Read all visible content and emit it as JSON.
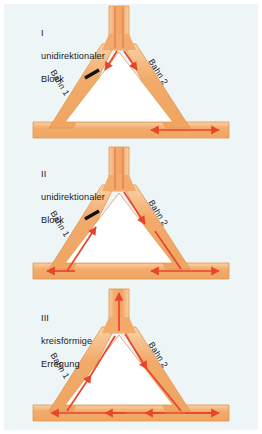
{
  "figure": {
    "background_color": "#eef5f6",
    "conduction_path_fill": "#f5b97a",
    "conduction_path_edge": "#e59a57",
    "conduction_path_highlight": "#fbd9b0",
    "arrow_color": "#e8452c",
    "block_mark_color": "#111111",
    "text_color": "#1b1b1b"
  },
  "panels": [
    {
      "roman": "I",
      "title_line_1": "unidirektionaler",
      "title_line_2": "Block",
      "branch_1_label": "Bahn 1",
      "branch_2_label": "Bahn 2",
      "has_block_mark": true,
      "stem_flow": "none",
      "left_branch_flow": "down-blocked",
      "right_branch_flow": "down",
      "bottom_bar_flow": "bidirectional-right-half"
    },
    {
      "roman": "II",
      "title_line_1": "unidirektionaler",
      "title_line_2": "Block",
      "branch_1_label": "Bahn 1",
      "branch_2_label": "Bahn 2",
      "has_block_mark": true,
      "stem_flow": "none",
      "left_branch_flow": "up",
      "right_branch_flow": "down",
      "bottom_bar_flow": "left-and-bidirectional-right"
    },
    {
      "roman": "III",
      "title_line_1": "kreisförmige",
      "title_line_2": "Erregung",
      "branch_1_label": "Bahn 1",
      "branch_2_label": "Bahn 2",
      "has_block_mark": false,
      "stem_flow": "up",
      "left_branch_flow": "up",
      "right_branch_flow": "down",
      "bottom_bar_flow": "leftward-chain-plus-right-end"
    }
  ]
}
